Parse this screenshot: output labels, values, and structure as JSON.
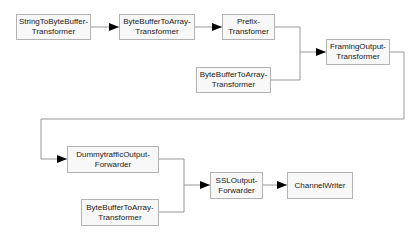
{
  "diagram": {
    "type": "pipeline-flowchart",
    "nodes": [
      {
        "id": "n1",
        "label": "StringToByteBuffer-\nTransformer"
      },
      {
        "id": "n2",
        "label": "ByteBufferToArray-\nTransformer"
      },
      {
        "id": "n3",
        "label": "Prefix-\nTransfomer"
      },
      {
        "id": "n4",
        "label": "ByteBufferToArray-\nTransformer"
      },
      {
        "id": "n5",
        "label": "FramingOutput-\nTransformer"
      },
      {
        "id": "n6",
        "label": "DummytrafficOutput-\nForwarder"
      },
      {
        "id": "n7",
        "label": "ByteBufferToArray-\nTransformer"
      },
      {
        "id": "n8",
        "label": "SSLOutput-\nForwarder"
      },
      {
        "id": "n9",
        "label": "ChannelWriter"
      }
    ],
    "edges": [
      {
        "from": "n1",
        "to": "n2"
      },
      {
        "from": "n2",
        "to": "n3"
      },
      {
        "from": "n3",
        "to": "n5"
      },
      {
        "from": "n4",
        "to": "n5"
      },
      {
        "from": "n5",
        "to": "n6"
      },
      {
        "from": "n6",
        "to": "n8"
      },
      {
        "from": "n7",
        "to": "n8"
      },
      {
        "from": "n8",
        "to": "n9"
      }
    ],
    "colors": {
      "line": "#999999",
      "arrow": "#000000",
      "box_border": "#b3b3b3",
      "box_fill": "#f8f8f8",
      "text": "#1a1a1a"
    }
  }
}
